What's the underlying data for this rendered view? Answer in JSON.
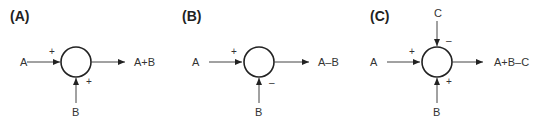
{
  "panels": [
    {
      "label": "(A)",
      "input_left": "A",
      "input_left_sign": "+",
      "input_bottom": "B",
      "input_bottom_sign": "+",
      "output": "A+B"
    },
    {
      "label": "(B)",
      "input_left": "A",
      "input_left_sign": "+",
      "input_bottom": "B",
      "input_bottom_sign": "–",
      "output": "A–B"
    },
    {
      "label": "(C)",
      "input_left": "A",
      "input_left_sign": "+",
      "input_bottom": "B",
      "input_bottom_sign": "+",
      "input_top": "C",
      "input_top_sign": "–",
      "output": "A+B–C"
    }
  ],
  "colors": {
    "stroke": "#222222",
    "text": "#333333",
    "background": "#ffffff"
  }
}
